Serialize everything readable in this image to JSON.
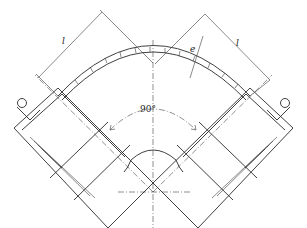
{
  "drawing": {
    "subject": "90-degree pipe elbow fitting",
    "labels": {
      "length_left": "l",
      "length_right": "l",
      "wall_thickness": "e",
      "angle": "90°"
    },
    "colors": {
      "line": "#2a2a2a",
      "background": "#ffffff"
    }
  }
}
